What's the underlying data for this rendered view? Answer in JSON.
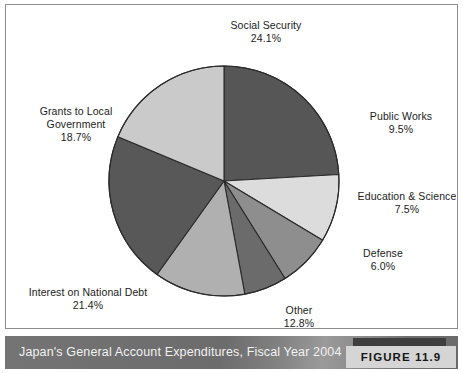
{
  "figure": {
    "caption": "Japan's General Account Expenditures, Fiscal Year 2004",
    "tag": "FIGURE 11.9"
  },
  "chart_data": {
    "type": "pie",
    "title": "Japan's General Account Expenditures, Fiscal Year 2004",
    "unit": "%",
    "legend_position": "none",
    "labels_position": "outside",
    "start_angle_deg": 0,
    "direction": "clockwise",
    "center": {
      "x": 218,
      "y": 176
    },
    "radius": 115,
    "categories": [
      "Social Security",
      "Public Works",
      "Education & Science",
      "Defense",
      "Other",
      "Interest on National Debt",
      "Grants to Local Government"
    ],
    "values": [
      24.1,
      9.5,
      7.5,
      6.0,
      12.8,
      21.4,
      18.7
    ],
    "value_labels": [
      "24.1%",
      "9.5%",
      "7.5%",
      "6.0%",
      "12.8%",
      "21.4%",
      "18.7%"
    ],
    "colors": [
      "#565656",
      "#dcdcdc",
      "#8e8e8e",
      "#6b6b6b",
      "#b0b0b0",
      "#585858",
      "#cacaca"
    ],
    "slices": [
      {
        "name": "Social Security",
        "value": 24.1,
        "value_label": "24.1%",
        "color": "#565656"
      },
      {
        "name": "Public Works",
        "value": 9.5,
        "value_label": "9.5%",
        "color": "#dcdcdc"
      },
      {
        "name": "Education & Science",
        "value": 7.5,
        "value_label": "7.5%",
        "color": "#8e8e8e"
      },
      {
        "name": "Defense",
        "value": 6.0,
        "value_label": "6.0%",
        "color": "#6b6b6b"
      },
      {
        "name": "Other",
        "value": 12.8,
        "value_label": "12.8%",
        "color": "#b0b0b0"
      },
      {
        "name": "Interest on National Debt",
        "value": 21.4,
        "value_label": "21.4%",
        "color": "#585858"
      },
      {
        "name": "Grants to Local Government",
        "value": 18.7,
        "value_label": "18.7%",
        "color": "#cacaca"
      }
    ]
  }
}
